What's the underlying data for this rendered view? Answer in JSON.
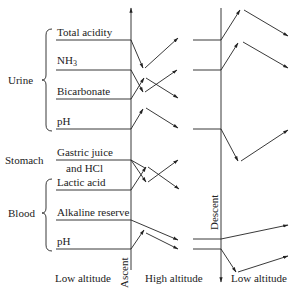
{
  "groups": {
    "urine": "Urine",
    "stomach": "Stomach",
    "blood": "Blood"
  },
  "rows": [
    {
      "label": "Total acidity"
    },
    {
      "label": "NH",
      "sub": "3"
    },
    {
      "label": "Bicarbonate"
    },
    {
      "label": "pH"
    },
    {
      "label": "Gastric juice",
      "label2": "and HCl"
    },
    {
      "label": "Lactic acid"
    },
    {
      "label": "Alkaline reserve"
    },
    {
      "label": "pH"
    }
  ],
  "axes": {
    "ascent": "Ascent",
    "descent": "Descent"
  },
  "bottom_labels": {
    "low_left": "Low altitude",
    "high": "High altitude",
    "low_right": "Low altitude"
  },
  "colors": {
    "line": "#222222",
    "text": "#222222"
  }
}
